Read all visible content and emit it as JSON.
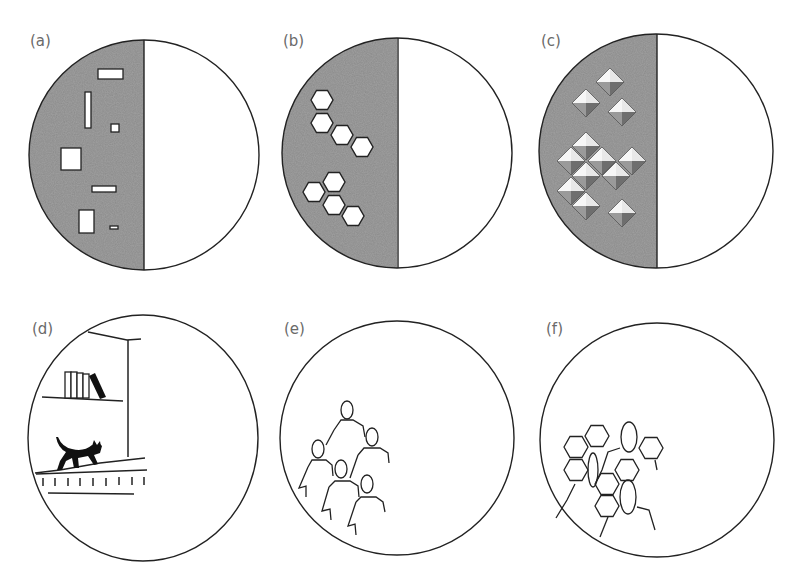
{
  "figure": {
    "panels": [
      {
        "label": "(a)",
        "content": "half-shaded circle with white rectangles on shaded half"
      },
      {
        "label": "(b)",
        "content": "half-shaded circle with two clusters of white hexagons on shaded half"
      },
      {
        "label": "(c)",
        "content": "half-shaded circle with 3D-shaded pyramid diamonds on shaded half"
      },
      {
        "label": "(d)",
        "content": "circle containing a line drawing of a shelf with books and a black cat walking on a ledge"
      },
      {
        "label": "(e)",
        "content": "circle containing outline drawing of a group of five people"
      },
      {
        "label": "(f)",
        "content": "circle containing outlines of people overlaid with hexagons"
      }
    ]
  },
  "colors": {
    "shade": "#8a8a8a",
    "stroke": "#222222",
    "label": "#6a6a6a",
    "background": "#ffffff"
  }
}
